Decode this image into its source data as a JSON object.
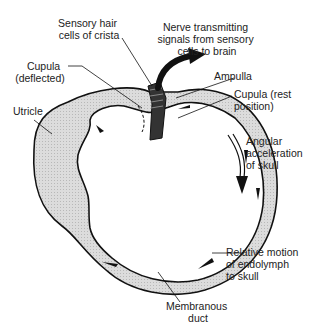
{
  "diagram": {
    "colors": {
      "outline": "#111111",
      "fill": "#d9d9d9",
      "background": "#ffffff",
      "text": "#222222"
    },
    "labels": {
      "sensory_hair_cells": [
        "Sensory hair",
        "cells of crista"
      ],
      "nerve": [
        "Nerve transmitting",
        "signals from sensory",
        "cells to brain"
      ],
      "cupula_deflected": [
        "Cupula",
        "(deflected)"
      ],
      "ampulla": [
        "Ampulla"
      ],
      "cupula_rest": [
        "Cupula (rest",
        "position)"
      ],
      "utricle": [
        "Utricle"
      ],
      "angular_acceleration": [
        "Angular",
        "acceleration",
        "of skull"
      ],
      "relative_motion": [
        "Relative motion",
        "of endolymph",
        "to skull"
      ],
      "membranous_duct": [
        "Membranous",
        "duct"
      ]
    }
  }
}
